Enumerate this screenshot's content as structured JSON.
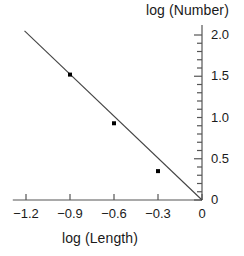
{
  "chart_data": {
    "type": "scatter",
    "title": "",
    "xlabel": "log (Length)",
    "ylabel": "log (Number)",
    "xlim": [
      -1.29,
      0.0
    ],
    "ylim": [
      0.0,
      2.12
    ],
    "grid": false,
    "legend": null,
    "x_ticks": [
      -1.2,
      -0.9,
      -0.6,
      -0.3,
      0
    ],
    "x_tick_labels": [
      "−1.2",
      "−0.9",
      "−0.6",
      "−0.3",
      "0"
    ],
    "y_ticks": [
      0,
      0.5,
      1.0,
      1.5,
      2.0
    ],
    "y_tick_labels": [
      "0",
      "0.5",
      "1.0",
      "1.5",
      "2.0"
    ],
    "y_minor_tick_step": 0.1,
    "y_axis_position": "right",
    "x": [
      -0.9,
      -0.6,
      -0.3
    ],
    "y": [
      1.52,
      0.93,
      0.35
    ],
    "points": [
      {
        "x": -0.9,
        "y": 1.52
      },
      {
        "x": -0.6,
        "y": 0.93
      },
      {
        "x": -0.3,
        "y": 0.35
      }
    ],
    "fit_line": {
      "x_start": -1.21,
      "y_start": 2.05,
      "x_end": 0.0,
      "y_end": 0.0,
      "slope": -1.694,
      "intercept": 0.0
    },
    "marker_color": "#000000",
    "line_color": "#444444",
    "axis_color": "#555555",
    "text_color": "#1a1a1a"
  }
}
